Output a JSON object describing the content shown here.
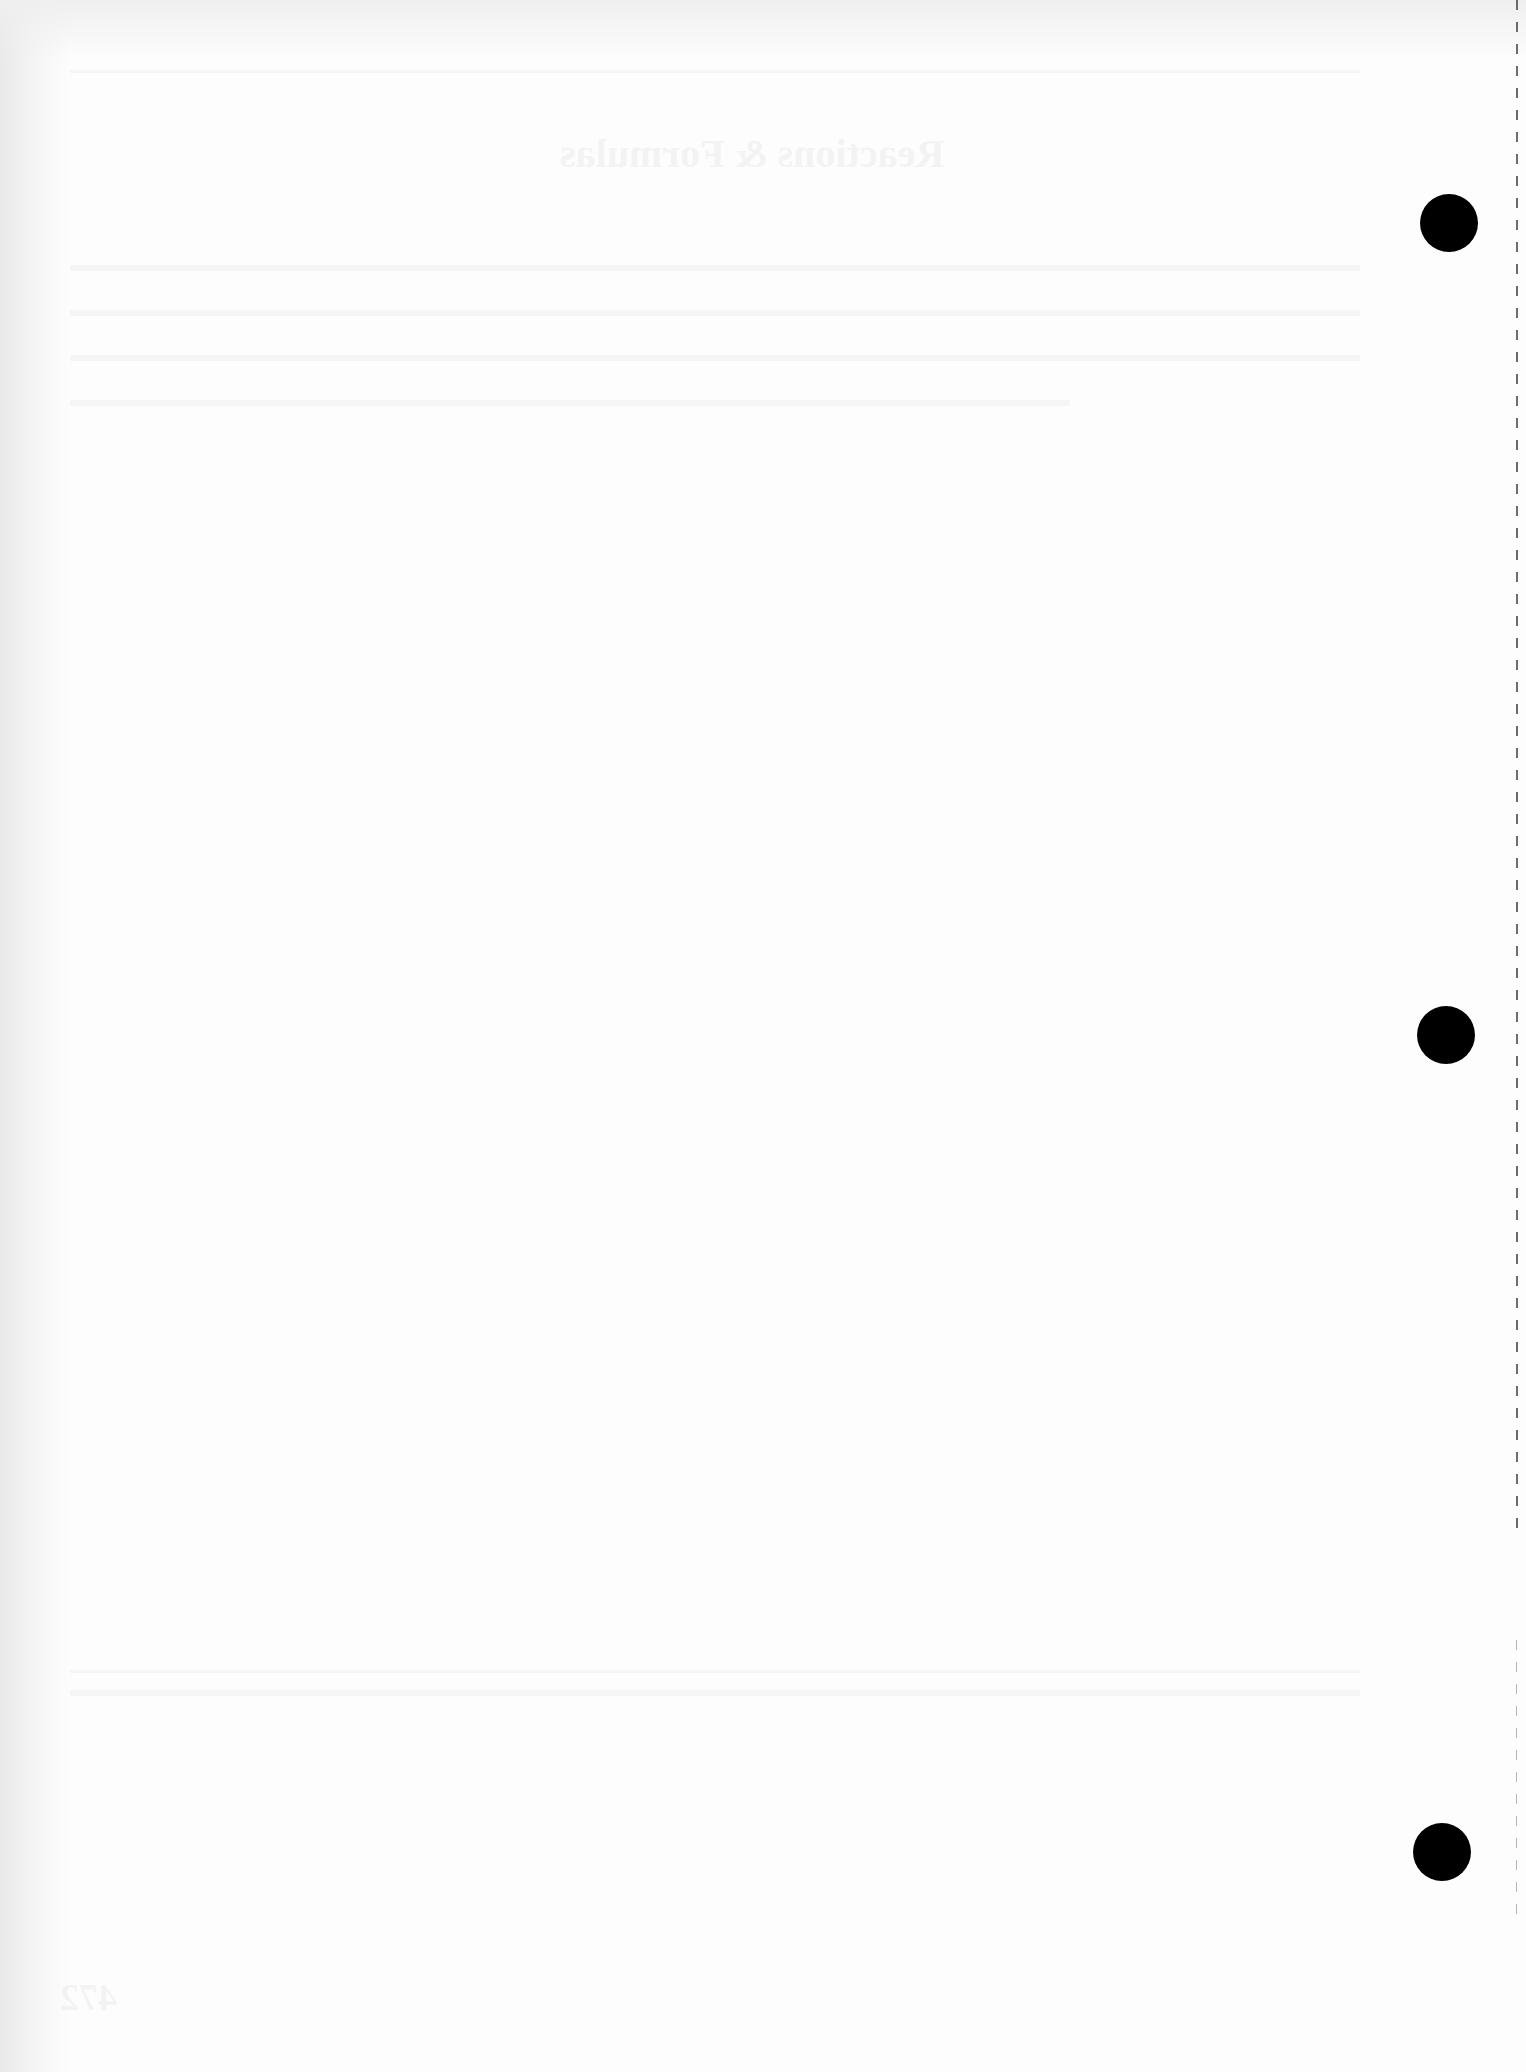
{
  "document": {
    "type": "blank scanned page",
    "bleed_through": {
      "title": "Reactions & Formulas",
      "page_number": "472",
      "legible": false
    },
    "punch_holes": [
      {
        "name": "top",
        "cx": 1449,
        "cy": 223
      },
      {
        "name": "middle",
        "cx": 1446,
        "cy": 1035
      },
      {
        "name": "bottom",
        "cx": 1442,
        "cy": 1852
      }
    ],
    "colors": {
      "paper": "#fdfdfd",
      "hole": "#000000",
      "perforation": "#6b6b6b"
    }
  }
}
